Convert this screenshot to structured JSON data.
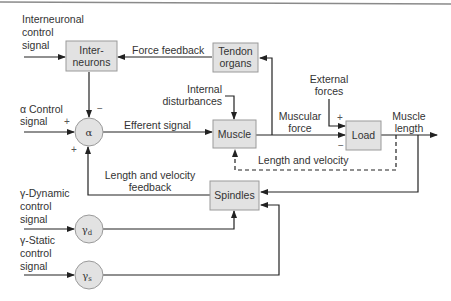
{
  "diagram": {
    "colors": {
      "block_fill": "#e2e2e2",
      "block_stroke": "#9a9a9a",
      "line": "#222222",
      "text": "#333333",
      "top_rule": "#8a8a8a"
    },
    "blocks": {
      "interneurons": {
        "line1": "Inter-",
        "line2": "neurons"
      },
      "tendon_organs": {
        "line1": "Tendon",
        "line2": "organs"
      },
      "muscle": {
        "label": "Muscle"
      },
      "load": {
        "label": "Load"
      },
      "spindles": {
        "label": "Spindles"
      }
    },
    "nodes": {
      "alpha": {
        "symbol": "α"
      },
      "gamma_d": {
        "symbol": "γ",
        "subscript": "d"
      },
      "gamma_s": {
        "symbol": "γ",
        "subscript": "s"
      }
    },
    "inputs": {
      "interneuronal": {
        "line1": "Interneuronal",
        "line2": "control",
        "line3": "signal"
      },
      "alpha": {
        "line1": "α Control",
        "line2": "signal"
      },
      "gamma_dynamic": {
        "line1": "γ-Dynamic",
        "line2": "control",
        "line3": "signal"
      },
      "gamma_static": {
        "line1": "γ-Static",
        "line2": "control",
        "line3": "signal"
      },
      "internal_disturbances": {
        "line1": "Internal",
        "line2": "disturbances"
      },
      "external_forces": {
        "line1": "External",
        "line2": "forces"
      }
    },
    "signals": {
      "force_feedback": "Force feedback",
      "efferent_signal": "Efferent signal",
      "muscular_force": {
        "line1": "Muscular",
        "line2": "force"
      },
      "muscle_length": {
        "line1": "Muscle",
        "line2": "length"
      },
      "length_and_velocity": "Length and velocity",
      "length_velocity_feedback": {
        "line1": "Length and velocity",
        "line2": "feedback"
      }
    },
    "signs": {
      "alpha_top": "−",
      "alpha_left": "+",
      "alpha_bottom": "+",
      "load_top": "+",
      "load_bottom": "−"
    }
  }
}
